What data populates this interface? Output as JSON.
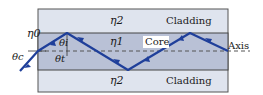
{
  "diagram": {
    "labels": {
      "cladding_top_index": "η2",
      "cladding_bottom_index": "η2",
      "core_index": "η1",
      "outside_index": "η0",
      "cladding_top": "Cladding",
      "cladding_bottom": "Cladding",
      "core": "Core",
      "axis": "Axis",
      "theta_c": "θc",
      "theta_i": "θi",
      "theta_t": "θt"
    },
    "colors": {
      "cladding": "#dfe4ee",
      "core": "#b9c1d6",
      "ray": "#1f3f9a",
      "border": "#444444"
    }
  }
}
